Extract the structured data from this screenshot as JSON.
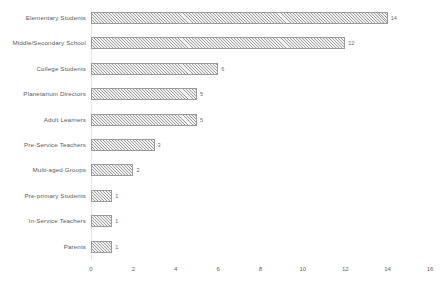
{
  "chart_data": {
    "type": "bar",
    "orientation": "horizontal",
    "title": "",
    "subtitle": "",
    "xlabel": "",
    "ylabel": "",
    "xlim": [
      0,
      16
    ],
    "xticks": [
      0,
      2,
      4,
      6,
      8,
      10,
      12,
      14,
      16
    ],
    "grid": false,
    "legend": null,
    "data_labels": true,
    "bar_style": {
      "fill": "#f3f3f3",
      "hatch": "diagonal",
      "hatch_color": "#9c9c9c",
      "border_color": "#9a9a9a"
    },
    "categories": [
      "Elementary Students",
      "Middle/Secondary School",
      "College Students",
      "Planetarium Directors",
      "Adult Learners",
      "Pre-Service Teachers",
      "Multi-aged Groups",
      "Pre-primary Students",
      "In-Service Teachers",
      "Parents"
    ],
    "values": [
      14,
      12,
      6,
      5,
      5,
      3,
      2,
      1,
      1,
      1
    ],
    "value_labels": [
      "14",
      "12",
      "6",
      "5",
      "5",
      "3",
      "2",
      "1",
      "1",
      "1"
    ],
    "tick_labels": [
      "0",
      "2",
      "4",
      "6",
      "8",
      "10",
      "12",
      "14",
      "16"
    ]
  }
}
